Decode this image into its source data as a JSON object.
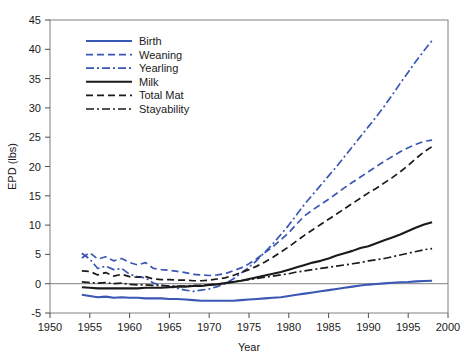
{
  "chart_data": {
    "type": "line",
    "title": "",
    "xlabel": "Year",
    "ylabel": "EPD (lbs)",
    "xlim": [
      1950,
      2000
    ],
    "ylim": [
      -5,
      45
    ],
    "xticks": [
      1950,
      1955,
      1960,
      1965,
      1970,
      1975,
      1980,
      1985,
      1990,
      1995,
      2000
    ],
    "yticks": [
      -5,
      0,
      5,
      10,
      15,
      20,
      25,
      30,
      35,
      40,
      45
    ],
    "grid": false,
    "zero_reference_line": true,
    "legend_position": "top-left-inside",
    "colors": {
      "blue": "#3a57b5",
      "black": "#1a1a1a",
      "axis": "#808080"
    },
    "x": [
      1954,
      1955,
      1956,
      1957,
      1958,
      1959,
      1960,
      1961,
      1962,
      1963,
      1964,
      1965,
      1966,
      1967,
      1968,
      1969,
      1970,
      1971,
      1972,
      1973,
      1974,
      1975,
      1976,
      1977,
      1978,
      1979,
      1980,
      1981,
      1982,
      1983,
      1984,
      1985,
      1986,
      1987,
      1988,
      1989,
      1990,
      1991,
      1992,
      1993,
      1994,
      1995,
      1996,
      1997,
      1998
    ],
    "series": [
      {
        "name": "Birth",
        "color": "#3a57b5",
        "dash": "solid",
        "values": [
          -1.9,
          -2.1,
          -2.3,
          -2.2,
          -2.4,
          -2.3,
          -2.4,
          -2.4,
          -2.5,
          -2.5,
          -2.5,
          -2.6,
          -2.6,
          -2.7,
          -2.8,
          -2.9,
          -2.9,
          -2.9,
          -2.9,
          -2.9,
          -2.8,
          -2.7,
          -2.6,
          -2.5,
          -2.4,
          -2.3,
          -2.1,
          -1.9,
          -1.7,
          -1.5,
          -1.3,
          -1.1,
          -0.9,
          -0.7,
          -0.5,
          -0.3,
          -0.15,
          -0.05,
          0.05,
          0.15,
          0.25,
          0.3,
          0.4,
          0.45,
          0.5
        ]
      },
      {
        "name": "Weaning",
        "color": "#3a57b5",
        "dash": "dashed",
        "values": [
          4.4,
          5.3,
          4.2,
          4.6,
          3.9,
          4.3,
          3.6,
          3.2,
          3.6,
          2.6,
          2.4,
          2.3,
          2.1,
          1.9,
          1.6,
          1.5,
          1.4,
          1.5,
          1.7,
          2.2,
          2.7,
          3.4,
          4.3,
          5.3,
          6.3,
          7.5,
          8.7,
          10.2,
          11.6,
          12.6,
          13.5,
          14.4,
          15.4,
          16.4,
          17.3,
          18.2,
          19.1,
          20.0,
          20.9,
          21.7,
          22.5,
          23.2,
          23.8,
          24.3,
          24.5
        ]
      },
      {
        "name": "Yearling",
        "color": "#3a57b5",
        "dash": "dashdot",
        "values": [
          5.2,
          4.2,
          2.6,
          3.0,
          2.4,
          2.6,
          1.6,
          1.2,
          1.0,
          0.1,
          -0.3,
          -0.5,
          -0.8,
          -1.1,
          -1.3,
          -1.1,
          -0.9,
          -0.5,
          0.0,
          0.8,
          1.8,
          2.8,
          4.0,
          5.4,
          6.8,
          8.4,
          10.0,
          11.8,
          13.6,
          15.2,
          16.8,
          18.4,
          20.0,
          21.7,
          23.4,
          25.1,
          26.8,
          28.5,
          30.3,
          32.2,
          34.2,
          36.1,
          38.0,
          39.8,
          41.5
        ]
      },
      {
        "name": "Milk",
        "color": "#1a1a1a",
        "dash": "solid",
        "values": [
          -0.6,
          -0.7,
          -0.8,
          -0.8,
          -0.8,
          -0.8,
          -0.8,
          -0.8,
          -0.7,
          -0.7,
          -0.7,
          -0.6,
          -0.5,
          -0.5,
          -0.4,
          -0.4,
          -0.2,
          -0.1,
          0.1,
          0.3,
          0.5,
          0.8,
          1.1,
          1.4,
          1.7,
          2.0,
          2.4,
          2.8,
          3.2,
          3.6,
          3.9,
          4.3,
          4.8,
          5.2,
          5.6,
          6.1,
          6.4,
          6.9,
          7.4,
          7.9,
          8.4,
          9.0,
          9.6,
          10.1,
          10.5
        ]
      },
      {
        "name": "Total Mat",
        "color": "#1a1a1a",
        "dash": "dashed",
        "values": [
          2.2,
          2.1,
          1.5,
          1.9,
          1.3,
          1.6,
          1.2,
          1.1,
          1.2,
          0.8,
          0.7,
          0.7,
          0.6,
          0.6,
          0.5,
          0.5,
          0.6,
          0.8,
          1.0,
          1.4,
          1.9,
          2.4,
          3.0,
          3.7,
          4.5,
          5.4,
          6.3,
          7.3,
          8.3,
          9.2,
          10.1,
          11.0,
          11.9,
          12.8,
          13.7,
          14.6,
          15.5,
          16.3,
          17.2,
          18.1,
          19.1,
          20.2,
          21.4,
          22.5,
          23.4
        ]
      },
      {
        "name": "Stayability",
        "color": "#1a1a1a",
        "dash": "dashdot",
        "values": [
          0.3,
          0.2,
          0.1,
          0.2,
          0.0,
          0.1,
          -0.1,
          -0.2,
          -0.2,
          -0.3,
          -0.3,
          -0.4,
          -0.4,
          -0.4,
          -0.3,
          -0.3,
          -0.2,
          -0.1,
          0.1,
          0.3,
          0.5,
          0.7,
          0.9,
          1.1,
          1.3,
          1.5,
          1.7,
          2.0,
          2.2,
          2.4,
          2.6,
          2.8,
          3.0,
          3.2,
          3.4,
          3.6,
          3.9,
          4.1,
          4.3,
          4.6,
          4.9,
          5.2,
          5.5,
          5.8,
          6.0
        ]
      }
    ],
    "legend": [
      {
        "label": "Birth",
        "color": "#3a57b5",
        "dash": "solid"
      },
      {
        "label": "Weaning",
        "color": "#3a57b5",
        "dash": "dashed"
      },
      {
        "label": "Yearling",
        "color": "#3a57b5",
        "dash": "dashdot"
      },
      {
        "label": "Milk",
        "color": "#1a1a1a",
        "dash": "solid"
      },
      {
        "label": "Total Mat",
        "color": "#1a1a1a",
        "dash": "dashed"
      },
      {
        "label": "Stayability",
        "color": "#1a1a1a",
        "dash": "dashdot"
      }
    ]
  }
}
